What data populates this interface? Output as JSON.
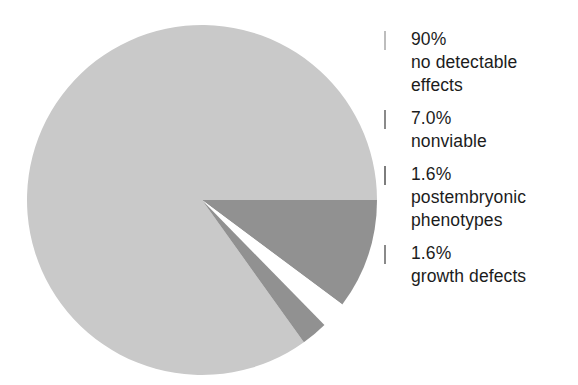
{
  "chart_data": {
    "type": "pie",
    "title": "",
    "subtitle": "",
    "xlabel": "",
    "ylabel": "",
    "grid": false,
    "legend_position": "right",
    "start_angle_deg": 0,
    "direction": "clockwise",
    "categories": [
      "no detectable effects",
      "nonviable",
      "postembryonic phenotypes",
      "growth defects"
    ],
    "values": [
      90,
      7.0,
      1.6,
      1.6
    ],
    "value_labels": [
      "90%",
      "7.0%",
      "1.6%",
      "1.6%"
    ],
    "colors": [
      "#c9c9c9",
      "#919191",
      "#ffffff",
      "#919191"
    ],
    "slices": [
      {
        "value_label": "90%",
        "label_line1": "no detectable",
        "label_line2": "effects",
        "value": 90,
        "color": "#c9c9c9",
        "swatch_border": "#c9c9c9",
        "start_deg": 54.4,
        "end_deg": 360
      },
      {
        "value_label": "7.0%",
        "label_line1": "nonviable",
        "label_line2": "",
        "value": 7.0,
        "color": "#919191",
        "swatch_border": "#919191",
        "start_deg": 0,
        "end_deg": 36.7
      },
      {
        "value_label": "1.6%",
        "label_line1": "postembryonic",
        "label_line2": "phenotypes",
        "value": 1.6,
        "color": "#ffffff",
        "swatch_border": "#7d7d7d",
        "start_deg": 36.7,
        "end_deg": 45.6
      },
      {
        "value_label": "1.6%",
        "label_line1": "growth defects",
        "label_line2": "",
        "value": 1.6,
        "color": "#919191",
        "swatch_border": "#919191",
        "start_deg": 45.6,
        "end_deg": 54.4
      }
    ]
  },
  "legend": {
    "items": [
      {
        "value": "90%",
        "line1": "no detectable",
        "line2": "effects",
        "color": "#c9c9c9",
        "border": "#bdbdbd"
      },
      {
        "value": "7.0%",
        "line1": "nonviable",
        "line2": "",
        "color": "#919191",
        "border": "#8a8a8a"
      },
      {
        "value": "1.6%",
        "line1": "postembryonic",
        "line2": "phenotypes",
        "color": "#ffffff",
        "border": "#7d7d7d"
      },
      {
        "value": "1.6%",
        "line1": "growth defects",
        "line2": "",
        "color": "#919191",
        "border": "#8a8a8a"
      }
    ]
  },
  "style": {
    "pie_center_x": 176,
    "pie_center_y": 176,
    "pie_radius": 175,
    "background": "#ffffff",
    "text_color": "#1c1c1c"
  }
}
